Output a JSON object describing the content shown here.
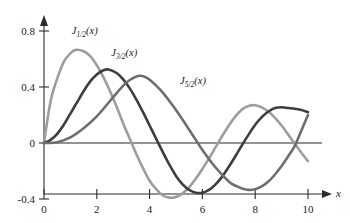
{
  "figure": {
    "background_color": "#ffffff",
    "axis_color": "#2b2b2b"
  },
  "chart_data": {
    "type": "line",
    "title": "",
    "subtitle": "",
    "xlabel": "x",
    "ylabel": "",
    "xlim": [
      0,
      10.4
    ],
    "ylim": [
      -0.4,
      0.9
    ],
    "grid": false,
    "legend_position": "inline-annotations",
    "xticks": [
      0,
      2,
      4,
      6,
      8,
      10
    ],
    "xtick_labels": [
      "0",
      "2",
      "4",
      "6",
      "8",
      "10"
    ],
    "yticks": [
      -0.4,
      0,
      0.4,
      0.8
    ],
    "ytick_labels": [
      "-0.4",
      "0",
      "0.4",
      "0.8"
    ],
    "annotations": [
      {
        "id": "label-j-half",
        "text_main": "J",
        "text_sub": "1/2",
        "text_tail": "(x)",
        "x": 1.05,
        "y": 0.78
      },
      {
        "id": "label-j-three-half",
        "text_main": "J",
        "text_sub": "3/2",
        "text_tail": "(x)",
        "x": 2.55,
        "y": 0.62
      },
      {
        "id": "label-j-five-half",
        "text_main": "J",
        "text_sub": "5/2",
        "text_tail": "(x)",
        "x": 5.15,
        "y": 0.42
      }
    ],
    "series": [
      {
        "name": "J_1/2(x)",
        "color": "#9d9d9d",
        "x": [
          0,
          0.25,
          0.5,
          0.75,
          1.0,
          1.2,
          1.5,
          1.75,
          2.0,
          2.25,
          2.5,
          2.75,
          3.0,
          3.25,
          3.5,
          3.75,
          4.0,
          4.25,
          4.5,
          4.75,
          5.0,
          5.25,
          5.5,
          5.75,
          6.0,
          6.25,
          6.5,
          6.75,
          7.0,
          7.25,
          7.5,
          7.75,
          8.0,
          8.25,
          8.5,
          8.75,
          9.0,
          9.25,
          9.5,
          9.75,
          10.0
        ],
        "values": [
          0,
          0.3,
          0.46,
          0.58,
          0.64,
          0.665,
          0.655,
          0.62,
          0.555,
          0.47,
          0.37,
          0.26,
          0.14,
          0.03,
          -0.08,
          -0.18,
          -0.27,
          -0.33,
          -0.375,
          -0.39,
          -0.385,
          -0.36,
          -0.315,
          -0.255,
          -0.185,
          -0.11,
          -0.03,
          0.05,
          0.125,
          0.19,
          0.24,
          0.265,
          0.27,
          0.255,
          0.225,
          0.18,
          0.125,
          0.06,
          -0.005,
          -0.07,
          -0.13
        ]
      },
      {
        "name": "J_3/2(x)",
        "color": "#3e3e3e",
        "x": [
          0,
          0.25,
          0.5,
          0.75,
          1.0,
          1.25,
          1.5,
          1.75,
          2.0,
          2.25,
          2.45,
          2.75,
          3.0,
          3.25,
          3.5,
          3.75,
          4.0,
          4.25,
          4.5,
          4.75,
          5.0,
          5.25,
          5.5,
          5.75,
          6.0,
          6.25,
          6.5,
          6.75,
          7.0,
          7.25,
          7.5,
          7.75,
          8.0,
          8.25,
          8.5,
          8.75,
          9.0,
          9.25,
          9.5,
          9.75,
          10.0
        ],
        "values": [
          0,
          0.022,
          0.065,
          0.13,
          0.21,
          0.29,
          0.37,
          0.44,
          0.49,
          0.52,
          0.525,
          0.5,
          0.455,
          0.39,
          0.31,
          0.22,
          0.125,
          0.03,
          -0.065,
          -0.155,
          -0.235,
          -0.295,
          -0.335,
          -0.355,
          -0.355,
          -0.335,
          -0.295,
          -0.24,
          -0.17,
          -0.095,
          -0.015,
          0.06,
          0.13,
          0.185,
          0.225,
          0.25,
          0.255,
          0.25,
          0.245,
          0.235,
          0.22
        ]
      },
      {
        "name": "J_5/2(x)",
        "color": "#6e6e6e",
        "x": [
          0,
          0.5,
          1.0,
          1.5,
          2.0,
          2.5,
          3.0,
          3.25,
          3.6,
          3.9,
          4.25,
          4.5,
          4.75,
          5.0,
          5.5,
          6.0,
          6.5,
          7.0,
          7.25,
          7.5,
          7.75,
          8.0,
          8.25,
          8.5,
          8.75,
          9.0,
          9.25,
          9.5,
          9.75,
          10.0
        ],
        "values": [
          0,
          0.006,
          0.04,
          0.105,
          0.19,
          0.3,
          0.41,
          0.45,
          0.48,
          0.465,
          0.41,
          0.36,
          0.3,
          0.235,
          0.095,
          -0.05,
          -0.175,
          -0.275,
          -0.305,
          -0.325,
          -0.335,
          -0.33,
          -0.31,
          -0.275,
          -0.225,
          -0.165,
          -0.095,
          -0.02,
          0.09,
          0.2
        ]
      }
    ]
  }
}
